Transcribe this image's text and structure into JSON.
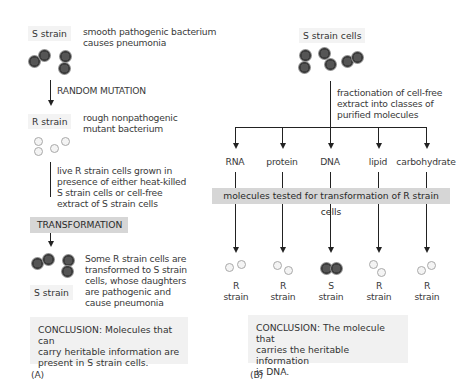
{
  "panel_a": {
    "s_strain_label": "S strain",
    "s_strain_desc": [
      "smooth pathogenic bacterium",
      "causes pneumonia"
    ],
    "random_mutation": "RANDOM MUTATION",
    "r_strain_label": "R strain",
    "r_strain_desc": [
      "rough nonpathogenic",
      "mutant bacterium"
    ],
    "growth_desc": [
      "live R strain cells grown in",
      "presence of either heat-killed",
      "S strain cells or cell-free",
      "extract of S strain cells"
    ],
    "transformation": "TRANSFORMATION",
    "result_desc": [
      "Some R strain cells are",
      "transformed to S strain",
      "cells, whose daughters",
      "are pathogenic and",
      "cause pneumonia"
    ],
    "result_label": "S strain",
    "conclusion": [
      "CONCLUSION: Molecules that can",
      "carry heritable information are",
      "present in S strain cells."
    ],
    "panel_label": "(A)"
  },
  "panel_b": {
    "s_cells_label": "S strain cells",
    "fractionation_desc": [
      "fractionation of cell-free",
      "extract into classes of",
      "purified molecules"
    ],
    "molecules": [
      {
        "name": "RNA",
        "result": [
          "R",
          "strain"
        ],
        "type": "R"
      },
      {
        "name": "protein",
        "result": [
          "R",
          "strain"
        ],
        "type": "R"
      },
      {
        "name": "DNA",
        "result": [
          "S",
          "strain"
        ],
        "type": "S"
      },
      {
        "name": "lipid",
        "result": [
          "R",
          "strain"
        ],
        "type": "R"
      },
      {
        "name": "carbohydrate",
        "result": [
          "R",
          "strain"
        ],
        "type": "R"
      }
    ],
    "test_banner": "molecules tested for transformation of R strain cells",
    "conclusion": [
      "CONCLUSION: The molecule that",
      "carries the heritable information",
      "is DNA."
    ],
    "panel_label": "(B)"
  },
  "colors": {
    "s_cell": "#444444",
    "r_cell_border": "#a9a9a9",
    "gray_banner": "#d6d6d6",
    "label_bg": "#f3f3f3",
    "line": "#222222"
  }
}
